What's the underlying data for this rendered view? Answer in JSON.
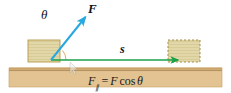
{
  "figure": {
    "background_color": "#ffffff"
  },
  "labels": {
    "force_vector": "F",
    "displacement_vector": "s",
    "angle": "θ"
  },
  "equation": {
    "symbol": "F",
    "subscript": "∥",
    "equals": "=",
    "rhs_symbol": "F",
    "function": "cos",
    "angle": "θ",
    "full_text": "F∥ = F cos θ"
  },
  "colors": {
    "force_arrow": "#29a8df",
    "displacement_arrow": "#19a24a",
    "block_fill": "#e2d7a8",
    "block_stroke": "#b59a48",
    "ground_fill": "#e0c391",
    "ground_edge": "#c79f62",
    "angle_arc": "#e08a2e",
    "text": "#111111"
  },
  "geometry": {
    "origin": {
      "x": 51,
      "y": 60
    },
    "force_arrow_tip": {
      "x": 88,
      "y": 14
    },
    "displacement_arrow_tip": {
      "x": 182,
      "y": 60
    },
    "block_initial": {
      "x": 28,
      "y": 40,
      "width": 32,
      "height": 22,
      "border": "solid"
    },
    "block_final": {
      "x": 168,
      "y": 40,
      "width": 32,
      "height": 22,
      "border": "dashed"
    },
    "ground": {
      "x": 9,
      "y": 68,
      "width": 213,
      "height": 19
    }
  },
  "elements": {
    "block_initial_name": "block-initial-position",
    "block_final_name": "block-final-position",
    "ground_name": "ground-surface",
    "cursor_name": "mouse-cursor"
  }
}
